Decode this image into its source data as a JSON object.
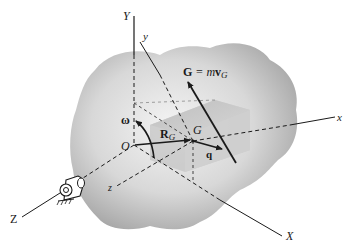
{
  "figure": {
    "type": "rigid-body rotation about fixed axis diagram",
    "labels": {
      "Y_axis": "Y",
      "y_axis": "y",
      "x_axis": "x",
      "X_axis": "X",
      "Z_axis": "Z",
      "z_axis": "z",
      "origin": "O",
      "center_of_mass": "G",
      "angular_velocity": "ω",
      "position_vector": "R",
      "position_vector_sub": "G",
      "q_vector": "q",
      "momentum_G": "G",
      "momentum_eq": " = m",
      "momentum_v": "v",
      "momentum_sub": "G"
    },
    "colors": {
      "background": "#ffffff",
      "body_fill_light": "#f2f2f2",
      "body_fill_dark": "#a8a8a8",
      "box_face": "#c9c9c9",
      "line": "#1a1a1a"
    }
  }
}
